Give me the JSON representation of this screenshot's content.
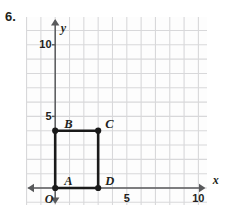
{
  "problem": {
    "number": "6."
  },
  "chart_data": {
    "type": "scatter",
    "title": "",
    "xlabel": "x",
    "ylabel": "y",
    "xlim": [
      -1,
      11.6
    ],
    "ylim": [
      -1.2,
      12
    ],
    "grid": true,
    "grid_step": 1,
    "x_ticks": [
      5,
      10
    ],
    "x_tick_labels": [
      "5",
      "10"
    ],
    "y_ticks": [
      5,
      10
    ],
    "y_tick_labels": [
      "5",
      "10"
    ],
    "origin_label": "O",
    "shape": {
      "name": "rectangle ABCD",
      "closed": true,
      "points": [
        {
          "label": "A",
          "x": 0,
          "y": 0,
          "label_dx": 9,
          "label_dy": -6
        },
        {
          "label": "B",
          "x": 0,
          "y": 4,
          "label_dx": 9,
          "label_dy": -6
        },
        {
          "label": "C",
          "x": 3,
          "y": 4,
          "label_dx": 7,
          "label_dy": -6
        },
        {
          "label": "D",
          "x": 3,
          "y": 0,
          "label_dx": 7,
          "label_dy": -6
        }
      ],
      "edges": [
        [
          "A",
          "B"
        ],
        [
          "B",
          "C"
        ],
        [
          "C",
          "D"
        ],
        [
          "D",
          "A"
        ]
      ]
    },
    "colors": {
      "grid": "#d8d8da",
      "axis": "#58595b",
      "shape": "#1a1a1a",
      "text": "#231f20",
      "background": "#fdfdfd"
    }
  }
}
